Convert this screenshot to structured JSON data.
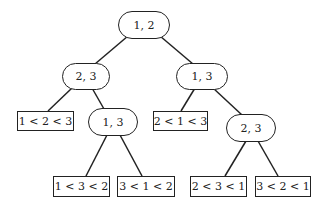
{
  "diagram": {
    "type": "decision-tree",
    "line_color": "#222222",
    "nodes": {
      "root": {
        "label": "1, 2",
        "kind": "comparison"
      },
      "l": {
        "label": "2, 3",
        "kind": "comparison"
      },
      "r": {
        "label": "1, 3",
        "kind": "comparison"
      },
      "ll": {
        "label": "1 < 2 < 3",
        "kind": "leaf"
      },
      "lr": {
        "label": "1, 3",
        "kind": "comparison"
      },
      "rl": {
        "label": "2 < 1 < 3",
        "kind": "leaf"
      },
      "rr": {
        "label": "2, 3",
        "kind": "comparison"
      },
      "lrl": {
        "label": "1 < 3 < 2",
        "kind": "leaf"
      },
      "lrr": {
        "label": "3 < 1 < 2",
        "kind": "leaf"
      },
      "rrl": {
        "label": "2 < 3 < 1",
        "kind": "leaf"
      },
      "rrr": {
        "label": "3 < 2 < 1",
        "kind": "leaf"
      }
    },
    "edges": [
      [
        "root",
        "l"
      ],
      [
        "root",
        "r"
      ],
      [
        "l",
        "ll"
      ],
      [
        "l",
        "lr"
      ],
      [
        "r",
        "rl"
      ],
      [
        "r",
        "rr"
      ],
      [
        "lr",
        "lrl"
      ],
      [
        "lr",
        "lrr"
      ],
      [
        "rr",
        "rrl"
      ],
      [
        "rr",
        "rrr"
      ]
    ]
  }
}
